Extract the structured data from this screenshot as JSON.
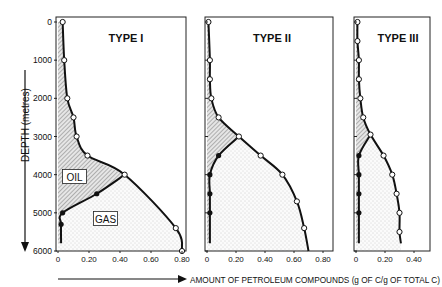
{
  "chart_data": [
    {
      "type": "area",
      "title": "TYPE I",
      "xlabel": "AMOUNT OF PETROLEUM COMPOUNDS (g OF C/g OF TOTAL C)",
      "ylabel": "DEPTH (metres)",
      "xlim": [
        0,
        0.8
      ],
      "ylim": [
        6000,
        0
      ],
      "xticks": [
        "0",
        "0.20",
        "0.40",
        "0.60",
        "0.80"
      ],
      "yticks": [
        "0",
        "1000",
        "2000",
        "3000",
        "4000",
        "5000",
        "6000"
      ],
      "annotations": [
        "OIL",
        "GAS"
      ],
      "series": [
        {
          "name": "total (open circles)",
          "points": [
            [
              0.03,
              0
            ],
            [
              0.04,
              1000
            ],
            [
              0.06,
              2000
            ],
            [
              0.1,
              2500
            ],
            [
              0.12,
              3000
            ],
            [
              0.19,
              3500
            ],
            [
              0.43,
              4000
            ],
            [
              0.76,
              5400
            ],
            [
              0.8,
              6000
            ]
          ]
        },
        {
          "name": "oil/gas boundary (filled circles)",
          "points": [
            [
              0.43,
              4000
            ],
            [
              0.25,
              4500
            ],
            [
              0.03,
              5000
            ],
            [
              0.02,
              5300
            ],
            [
              0.02,
              5800
            ]
          ]
        }
      ]
    },
    {
      "type": "area",
      "title": "TYPE II",
      "xlim": [
        0,
        0.8
      ],
      "ylim": [
        6000,
        0
      ],
      "xticks": [
        "0",
        "0.20",
        "0.40",
        "0.60",
        "0.80"
      ],
      "series": [
        {
          "name": "total (open circles)",
          "points": [
            [
              0.01,
              0
            ],
            [
              0.02,
              1000
            ],
            [
              0.02,
              1500
            ],
            [
              0.03,
              2000
            ],
            [
              0.08,
              2500
            ],
            [
              0.22,
              3000
            ],
            [
              0.37,
              3500
            ],
            [
              0.52,
              4000
            ],
            [
              0.62,
              4700
            ],
            [
              0.67,
              5400
            ],
            [
              0.7,
              6000
            ]
          ]
        },
        {
          "name": "oil/gas boundary (filled circles)",
          "points": [
            [
              0.22,
              3000
            ],
            [
              0.08,
              3500
            ],
            [
              0.02,
              4000
            ],
            [
              0.02,
              4500
            ],
            [
              0.02,
              5000
            ],
            [
              0.02,
              5800
            ]
          ]
        }
      ]
    },
    {
      "type": "area",
      "title": "TYPE III",
      "xlim": [
        0,
        0.4
      ],
      "ylim": [
        6000,
        0
      ],
      "xticks": [
        "0",
        "0.20",
        "0.40"
      ],
      "series": [
        {
          "name": "total (open circles)",
          "points": [
            [
              0.01,
              0
            ],
            [
              0.01,
              500
            ],
            [
              0.02,
              1000
            ],
            [
              0.02,
              1500
            ],
            [
              0.03,
              2000
            ],
            [
              0.05,
              2500
            ],
            [
              0.1,
              2950
            ],
            [
              0.19,
              3500
            ],
            [
              0.25,
              4000
            ],
            [
              0.28,
              4500
            ],
            [
              0.3,
              5000
            ],
            [
              0.3,
              5500
            ],
            [
              0.31,
              5800
            ]
          ]
        },
        {
          "name": "oil/gas boundary (filled circles)",
          "points": [
            [
              0.1,
              2950
            ],
            [
              0.02,
              3500
            ],
            [
              0.02,
              4000
            ],
            [
              0.02,
              4500
            ],
            [
              0.02,
              5000
            ],
            [
              0.02,
              5800
            ]
          ]
        }
      ]
    }
  ],
  "labels": {
    "ylabel": "DEPTH (metres)",
    "xlabel": "AMOUNT OF PETROLEUM COMPOUNDS (g OF C/g OF TOTAL C)",
    "oil": "OIL",
    "gas": "GAS"
  }
}
